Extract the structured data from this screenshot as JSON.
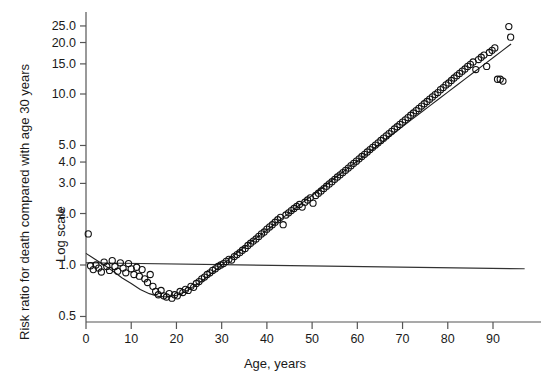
{
  "chart_data": {
    "type": "scatter",
    "title": "",
    "xlabel": "Age, years",
    "ylabel": "Risk ratio for death compared with age 30 years",
    "ylabel2": "Log scale",
    "yscale": "log",
    "xlim": [
      0,
      97
    ],
    "ylim": [
      0.5,
      27
    ],
    "grid": false,
    "legend": null,
    "xticks": [
      0,
      10,
      20,
      30,
      40,
      50,
      60,
      70,
      80,
      90
    ],
    "xticklabels": [
      "0",
      "10",
      "20",
      "30",
      "40",
      "50",
      "60",
      "70",
      "80",
      "90"
    ],
    "yticks": [
      0.5,
      1.0,
      2.0,
      3.0,
      4.0,
      5.0,
      10.0,
      15.0,
      20.0,
      25.0
    ],
    "yticklabels": [
      "0.5",
      "1.0",
      "2.0",
      "3.0",
      "4.0",
      "5.0",
      "10.0",
      "15.0",
      "20.0",
      "25.0"
    ],
    "reference_line": {
      "name": "risk-ratio-unity-line",
      "x": [
        0,
        97
      ],
      "y": [
        1.03,
        0.95
      ]
    },
    "fitted_curve": {
      "name": "fitted-risk-curve",
      "x": [
        0,
        2,
        4,
        6,
        8,
        10,
        12,
        14,
        16,
        18,
        20,
        22,
        24,
        26,
        28,
        30,
        32,
        34,
        36,
        38,
        40,
        42,
        44,
        46,
        48,
        50,
        52,
        54,
        56,
        58,
        60,
        62,
        64,
        66,
        68,
        70,
        72,
        74,
        76,
        78,
        80,
        82,
        84,
        86,
        88,
        90,
        92,
        94
      ],
      "y": [
        1.17,
        1.08,
        1.0,
        0.92,
        0.84,
        0.78,
        0.72,
        0.68,
        0.655,
        0.65,
        0.665,
        0.7,
        0.755,
        0.82,
        0.905,
        1.0,
        1.1,
        1.21,
        1.33,
        1.46,
        1.6,
        1.76,
        1.93,
        2.12,
        2.33,
        2.55,
        2.8,
        3.07,
        3.37,
        3.7,
        4.06,
        4.45,
        4.88,
        5.36,
        5.88,
        6.45,
        7.08,
        7.77,
        8.52,
        9.35,
        10.26,
        11.25,
        12.35,
        13.55,
        14.86,
        16.3,
        17.88,
        19.62
      ]
    },
    "series": [
      {
        "name": "risk ratio by age",
        "marker": "open-circle",
        "points": [
          [
            0.5,
            1.52
          ],
          [
            1,
            0.99
          ],
          [
            1.6,
            0.94
          ],
          [
            2.2,
            1.0
          ],
          [
            2.8,
            0.96
          ],
          [
            3.4,
            0.91
          ],
          [
            4,
            1.04
          ],
          [
            4.6,
            0.98
          ],
          [
            5.2,
            0.93
          ],
          [
            5.8,
            1.06
          ],
          [
            6.4,
            0.98
          ],
          [
            7,
            0.92
          ],
          [
            7.6,
            1.03
          ],
          [
            8.2,
            0.96
          ],
          [
            8.8,
            0.9
          ],
          [
            9.4,
            1.02
          ],
          [
            10,
            0.95
          ],
          [
            10.6,
            0.88
          ],
          [
            11.2,
            0.97
          ],
          [
            11.8,
            0.86
          ],
          [
            12.4,
            0.94
          ],
          [
            13,
            0.83
          ],
          [
            13.6,
            0.79
          ],
          [
            14.2,
            0.88
          ],
          [
            14.8,
            0.75
          ],
          [
            15.4,
            0.7
          ],
          [
            16,
            0.67
          ],
          [
            16.6,
            0.71
          ],
          [
            17.2,
            0.66
          ],
          [
            17.8,
            0.65
          ],
          [
            18.4,
            0.68
          ],
          [
            19,
            0.64
          ],
          [
            19.6,
            0.67
          ],
          [
            20.2,
            0.66
          ],
          [
            20.8,
            0.7
          ],
          [
            21.4,
            0.69
          ],
          [
            22,
            0.72
          ],
          [
            22.6,
            0.71
          ],
          [
            23.2,
            0.75
          ],
          [
            23.8,
            0.74
          ],
          [
            24.4,
            0.78
          ],
          [
            25,
            0.8
          ],
          [
            25.6,
            0.83
          ],
          [
            26.2,
            0.85
          ],
          [
            26.8,
            0.88
          ],
          [
            27.4,
            0.9
          ],
          [
            28,
            0.93
          ],
          [
            28.6,
            0.95
          ],
          [
            29.2,
            0.98
          ],
          [
            29.8,
            1.0
          ],
          [
            30.4,
            1.02
          ],
          [
            31,
            1.05
          ],
          [
            31.6,
            1.08
          ],
          [
            32.2,
            1.07
          ],
          [
            32.8,
            1.12
          ],
          [
            33.4,
            1.15
          ],
          [
            34,
            1.18
          ],
          [
            34.6,
            1.22
          ],
          [
            35.2,
            1.25
          ],
          [
            35.8,
            1.3
          ],
          [
            36.4,
            1.34
          ],
          [
            37,
            1.38
          ],
          [
            37.6,
            1.42
          ],
          [
            38.2,
            1.47
          ],
          [
            38.8,
            1.52
          ],
          [
            39.4,
            1.56
          ],
          [
            40,
            1.62
          ],
          [
            40.6,
            1.67
          ],
          [
            41.2,
            1.72
          ],
          [
            41.8,
            1.78
          ],
          [
            42.4,
            1.84
          ],
          [
            43,
            1.9
          ],
          [
            43.6,
            1.72
          ],
          [
            44.2,
            1.96
          ],
          [
            44.8,
            2.02
          ],
          [
            45.4,
            2.08
          ],
          [
            46,
            2.14
          ],
          [
            46.6,
            2.2
          ],
          [
            47.2,
            2.26
          ],
          [
            47.8,
            2.18
          ],
          [
            48.4,
            2.33
          ],
          [
            49,
            2.4
          ],
          [
            49.6,
            2.47
          ],
          [
            50.2,
            2.3
          ],
          [
            50.8,
            2.55
          ],
          [
            51.4,
            2.63
          ],
          [
            52,
            2.71
          ],
          [
            52.6,
            2.8
          ],
          [
            53.2,
            2.89
          ],
          [
            53.8,
            2.98
          ],
          [
            54.4,
            3.07
          ],
          [
            55,
            3.17
          ],
          [
            55.6,
            3.27
          ],
          [
            56.2,
            3.37
          ],
          [
            56.8,
            3.47
          ],
          [
            57.4,
            3.58
          ],
          [
            58,
            3.69
          ],
          [
            58.6,
            3.81
          ],
          [
            59.2,
            3.93
          ],
          [
            59.8,
            4.05
          ],
          [
            60.4,
            4.18
          ],
          [
            61,
            4.31
          ],
          [
            61.6,
            4.44
          ],
          [
            62.2,
            4.58
          ],
          [
            62.8,
            4.73
          ],
          [
            63.4,
            4.88
          ],
          [
            64,
            5.03
          ],
          [
            64.6,
            5.18
          ],
          [
            65.2,
            5.35
          ],
          [
            65.8,
            5.52
          ],
          [
            66.4,
            5.69
          ],
          [
            67,
            5.87
          ],
          [
            67.6,
            6.05
          ],
          [
            68.2,
            6.24
          ],
          [
            68.8,
            6.44
          ],
          [
            69.4,
            6.64
          ],
          [
            70,
            6.85
          ],
          [
            70.6,
            7.06
          ],
          [
            71.2,
            7.28
          ],
          [
            71.8,
            7.51
          ],
          [
            72.4,
            7.75
          ],
          [
            73,
            7.99
          ],
          [
            73.6,
            8.24
          ],
          [
            74.2,
            8.5
          ],
          [
            74.8,
            8.77
          ],
          [
            75.4,
            9.04
          ],
          [
            76,
            9.33
          ],
          [
            76.6,
            9.62
          ],
          [
            77.2,
            9.92
          ],
          [
            77.8,
            10.2
          ],
          [
            78.4,
            10.6
          ],
          [
            79,
            10.9
          ],
          [
            79.6,
            11.3
          ],
          [
            80.2,
            11.6
          ],
          [
            80.8,
            12.0
          ],
          [
            81.4,
            12.4
          ],
          [
            82,
            12.8
          ],
          [
            82.6,
            13.2
          ],
          [
            83.2,
            13.6
          ],
          [
            83.8,
            14.0
          ],
          [
            84.4,
            14.5
          ],
          [
            85,
            14.9
          ],
          [
            85.6,
            15.4
          ],
          [
            86.2,
            13.9
          ],
          [
            86.8,
            15.9
          ],
          [
            87.4,
            16.4
          ],
          [
            88,
            16.9
          ],
          [
            88.6,
            14.5
          ],
          [
            89.2,
            17.5
          ],
          [
            89.8,
            18.0
          ],
          [
            90.4,
            18.6
          ],
          [
            91,
            12.2
          ],
          [
            91.6,
            12.2
          ],
          [
            92.2,
            11.9
          ],
          [
            93.5,
            24.8
          ],
          [
            93.9,
            21.5
          ]
        ]
      }
    ]
  },
  "axis_labels": {
    "x_title": "Age, years",
    "y_title": "Risk ratio for death compared with age 30 years",
    "y_subtitle": "Log scale"
  }
}
